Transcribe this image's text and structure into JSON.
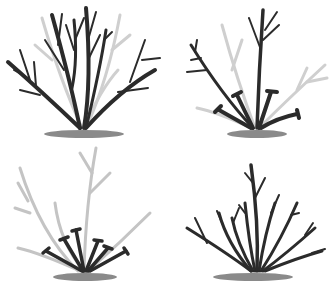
{
  "title": "",
  "colors": {
    "dark": "#2b2b2b",
    "light": "#c4c4c4",
    "ground": "#8a8a8a"
  },
  "panels": [
    {
      "id": "panel-1",
      "description": "Overgrown shrub with dense dark and faded branches"
    },
    {
      "id": "panel-2",
      "description": "Shrub with several old stems cut back near base"
    },
    {
      "id": "panel-3",
      "description": "All stems cut back near ground, faded outline of former growth"
    },
    {
      "id": "panel-4",
      "description": "Renewed shrub with fresh evenly spaced stems"
    }
  ]
}
